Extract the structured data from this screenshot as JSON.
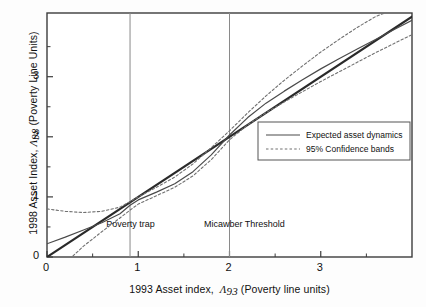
{
  "chart_data": {
    "type": "line",
    "title": "",
    "xlabel": "1993 Asset index,  Λ93 (Poverty line units)",
    "ylabel": "1998 Asset Index,  Λ98 (Poverty Line Units)",
    "xlabel_parts": {
      "main": "1993 Asset index,",
      "symbol": "Λ",
      "symbol_sub": "93",
      "units": "(Poverty line units)"
    },
    "ylabel_parts": {
      "main": "1998 Asset Index,",
      "symbol": "Λ",
      "symbol_sub": "98",
      "units": "(Poverty Line Units)"
    },
    "xlim": [
      0,
      4.0
    ],
    "ylim": [
      0,
      4.06
    ],
    "x_ticks": [
      0,
      1,
      2,
      3
    ],
    "x_tick_labels": [
      "0",
      "1",
      "2",
      "3"
    ],
    "x_minor_ticks": [
      0.5,
      1.5,
      2.5,
      3.5
    ],
    "y_ticks": [
      0,
      1,
      2,
      3
    ],
    "y_tick_labels": [
      "0",
      "1",
      "2",
      "3"
    ],
    "y_minor_ticks": [
      0.5,
      1.5,
      2.5,
      3.5
    ],
    "grid": false,
    "legend_position": "right-center",
    "series": [
      {
        "name": "Identity line (45 degrees)",
        "style": "solid-thick",
        "color": "#2a2a2a",
        "points": [
          [
            0,
            0
          ],
          [
            4.0,
            4.0
          ]
        ]
      },
      {
        "name": "Expected asset dynamics",
        "style": "solid",
        "color": "#4a4a4a",
        "points": [
          [
            0.0,
            0.22
          ],
          [
            0.2,
            0.33
          ],
          [
            0.4,
            0.45
          ],
          [
            0.6,
            0.57
          ],
          [
            0.8,
            0.72
          ],
          [
            0.91,
            0.86
          ],
          [
            1.0,
            0.95
          ],
          [
            1.2,
            1.08
          ],
          [
            1.4,
            1.22
          ],
          [
            1.6,
            1.42
          ],
          [
            1.8,
            1.7
          ],
          [
            2.0,
            2.03
          ],
          [
            2.2,
            2.32
          ],
          [
            2.4,
            2.56
          ],
          [
            2.6,
            2.76
          ],
          [
            2.8,
            2.95
          ],
          [
            3.0,
            3.13
          ],
          [
            3.2,
            3.3
          ],
          [
            3.4,
            3.46
          ],
          [
            3.6,
            3.62
          ],
          [
            3.8,
            3.78
          ],
          [
            4.0,
            3.94
          ]
        ]
      },
      {
        "name": "95% Confidence band (upper)",
        "style": "dotted",
        "color": "#707070",
        "points": [
          [
            0.0,
            0.8
          ],
          [
            0.2,
            0.76
          ],
          [
            0.4,
            0.74
          ],
          [
            0.6,
            0.76
          ],
          [
            0.8,
            0.83
          ],
          [
            0.91,
            0.92
          ],
          [
            1.0,
            1.0
          ],
          [
            1.2,
            1.16
          ],
          [
            1.4,
            1.33
          ],
          [
            1.6,
            1.55
          ],
          [
            1.8,
            1.82
          ],
          [
            2.0,
            2.1
          ],
          [
            2.2,
            2.4
          ],
          [
            2.4,
            2.68
          ],
          [
            2.6,
            2.94
          ],
          [
            2.8,
            3.18
          ],
          [
            3.0,
            3.41
          ],
          [
            3.2,
            3.62
          ],
          [
            3.4,
            3.82
          ],
          [
            3.6,
            4.0
          ],
          [
            3.7,
            4.06
          ]
        ]
      },
      {
        "name": "95% Confidence band (lower)",
        "style": "dotted",
        "color": "#707070",
        "points": [
          [
            0.0,
            -0.42
          ],
          [
            0.2,
            -0.1
          ],
          [
            0.4,
            0.18
          ],
          [
            0.6,
            0.42
          ],
          [
            0.8,
            0.65
          ],
          [
            0.91,
            0.78
          ],
          [
            1.0,
            0.88
          ],
          [
            1.2,
            1.02
          ],
          [
            1.4,
            1.16
          ],
          [
            1.6,
            1.35
          ],
          [
            1.8,
            1.62
          ],
          [
            2.0,
            1.95
          ],
          [
            2.2,
            2.2
          ],
          [
            2.4,
            2.4
          ],
          [
            2.6,
            2.58
          ],
          [
            2.8,
            2.75
          ],
          [
            3.0,
            2.92
          ],
          [
            3.2,
            3.08
          ],
          [
            3.4,
            3.24
          ],
          [
            3.6,
            3.4
          ],
          [
            3.8,
            3.55
          ],
          [
            4.0,
            3.7
          ]
        ]
      }
    ],
    "reference_lines": [
      {
        "name": "Poverty trap",
        "orientation": "vertical",
        "x": 0.91,
        "label": "Poverty trap",
        "label_x": 0.65,
        "label_y": 0.53
      },
      {
        "name": "Micawber Threshold",
        "orientation": "vertical",
        "x": 2.0,
        "label": "Micawber Threshold",
        "label_x": 1.72,
        "label_y": 0.53
      }
    ],
    "annotations": [
      {
        "text": "Poverty trap"
      },
      {
        "text": "Micawber Threshold"
      }
    ],
    "legend": {
      "entries": [
        {
          "label": "Expected asset dynamics",
          "style": "solid",
          "color": "#4a4a4a"
        },
        {
          "label": "95% Confidence bands",
          "style": "dotted",
          "color": "#707070"
        }
      ]
    }
  }
}
